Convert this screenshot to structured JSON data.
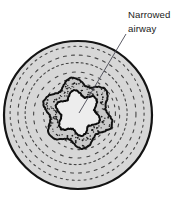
{
  "figure": {
    "type": "medical-cross-section-illustration",
    "background_color": "#ffffff",
    "annotations": [
      {
        "id": "narrowed-airway-label",
        "line1": "Narrowed",
        "line2": "airway",
        "text": "Narrowed airway",
        "text_color": "#1a1a1a",
        "x": 128,
        "y": 18,
        "leader_line": {
          "from_x": 126,
          "from_y": 34,
          "to_x": 79,
          "to_y": 113,
          "color": "#4a4a55"
        }
      }
    ],
    "structures": [
      {
        "id": "outer-tissue-circle",
        "label": "Surrounding lung tissue",
        "shape": "circle",
        "cx": 78,
        "cy": 115,
        "r": 74,
        "fill": "#d7d7d7",
        "stroke": "#141414",
        "stroke_width": 2.2
      },
      {
        "id": "concentric-dashed-rings",
        "label": "Concentric dashed tissue rings",
        "shape": "dashed-circles",
        "cx": 78,
        "cy": 115,
        "radii": [
          67,
          59,
          51,
          43,
          36,
          30
        ],
        "stroke": "#2b2b2b",
        "stroke_width": 1.1,
        "dash_patterns": [
          "2,4",
          "3,5",
          "2,3",
          "3,6",
          "2,5",
          "2,4"
        ]
      },
      {
        "id": "airway-wall",
        "label": "Thickened stippled airway wall",
        "shape": "star-lobed-ring",
        "cx": 78,
        "cy": 113,
        "outer_radius": 32,
        "inner_radius": 20,
        "lobes": 6,
        "fill": "#c9c9c9",
        "stroke": "#111111",
        "stroke_width": 2.0,
        "stipple_color": "#1c1c1c",
        "stipple_count": 150
      },
      {
        "id": "airway-lumen",
        "label": "Narrowed lumen",
        "shape": "star-lobed",
        "cx": 78,
        "cy": 113,
        "radius": 20,
        "lobes": 6,
        "fill": "#ededed",
        "stroke": "#0d0d0d",
        "stroke_width": 2.0
      }
    ]
  }
}
